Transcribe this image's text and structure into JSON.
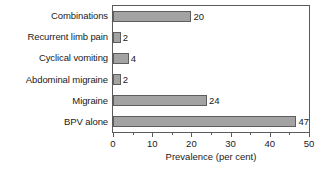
{
  "chart_data": {
    "type": "bar",
    "orientation": "horizontal",
    "title": "",
    "xlabel": "Prevalence (per cent)",
    "ylabel": "",
    "categories": [
      "Combinations",
      "Recurrent limb pain",
      "Cyclical vomiting",
      "Abdominal migraine",
      "Migraine",
      "BPV alone"
    ],
    "values": [
      20,
      2,
      4,
      2,
      24,
      47
    ],
    "value_labels": [
      "20",
      "2",
      "4",
      "2",
      "24",
      "47"
    ],
    "xlim": [
      0,
      50
    ],
    "xticks": [
      0,
      10,
      20,
      30,
      40,
      50
    ],
    "xtick_labels": [
      "0",
      "10",
      "20",
      "30",
      "40",
      "50"
    ],
    "xminor_ticks": [
      5,
      15,
      25,
      35,
      45
    ],
    "grid": false,
    "legend": false,
    "bar_fill_color": "#a3a3a3",
    "bar_border_color": "#5e5e5e",
    "axis_color": "#5a5a5a",
    "text_color": "#1a1a1a",
    "background_color": "#ffffff"
  }
}
